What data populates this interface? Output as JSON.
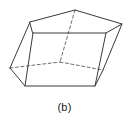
{
  "figure": {
    "caption": "(b)",
    "shape_name": "oblique-pentagonal-prism",
    "colors": {
      "background": "#ffffff",
      "edge_visible": "#3a3a3a",
      "edge_hidden": "#6e6e6e",
      "caption_text": "#1a1a1a"
    },
    "stroke": {
      "visible_width": 1,
      "hidden_width": 1,
      "hidden_dash": "3,2.5"
    },
    "viewbox": "0 0 129 96",
    "vertices": {
      "top_back_left": [
        30,
        22
      ],
      "top_apex": [
        75,
        10
      ],
      "top_back_right": [
        122,
        24
      ],
      "top_front_right": [
        106,
        33
      ],
      "top_front_left": [
        33,
        33
      ],
      "bottom_back_left": [
        10,
        68
      ],
      "bottom_apex": [
        60,
        62
      ],
      "bottom_back_right": [
        103,
        70
      ],
      "bottom_front_right": [
        95,
        86
      ],
      "bottom_front_left": [
        25,
        86
      ]
    },
    "edges_visible": [
      {
        "name": "top-edge-back-left-to-apex",
        "from": [
          30,
          22
        ],
        "to": [
          75,
          10
        ]
      },
      {
        "name": "top-edge-apex-to-back-right",
        "from": [
          75,
          10
        ],
        "to": [
          122,
          24
        ]
      },
      {
        "name": "top-edge-back-right-to-front-right",
        "from": [
          122,
          24
        ],
        "to": [
          106,
          33
        ]
      },
      {
        "name": "top-edge-front-right-to-front-left",
        "from": [
          106,
          33
        ],
        "to": [
          33,
          33
        ]
      },
      {
        "name": "top-edge-front-left-to-back-left",
        "from": [
          33,
          33
        ],
        "to": [
          30,
          22
        ]
      },
      {
        "name": "lateral-edge-back-left",
        "from": [
          30,
          22
        ],
        "to": [
          10,
          68
        ]
      },
      {
        "name": "lateral-edge-front-left",
        "from": [
          33,
          33
        ],
        "to": [
          25,
          86
        ]
      },
      {
        "name": "lateral-edge-front-right",
        "from": [
          106,
          33
        ],
        "to": [
          95,
          86
        ]
      },
      {
        "name": "lateral-edge-back-right",
        "from": [
          122,
          24
        ],
        "to": [
          103,
          70
        ]
      },
      {
        "name": "bottom-edge-front-left-to-front-right",
        "from": [
          25,
          86
        ],
        "to": [
          95,
          86
        ]
      },
      {
        "name": "bottom-edge-back-left-to-front-left",
        "from": [
          10,
          68
        ],
        "to": [
          25,
          86
        ]
      },
      {
        "name": "bottom-edge-front-right-to-back-right",
        "from": [
          95,
          86
        ],
        "to": [
          103,
          70
        ]
      }
    ],
    "edges_hidden": [
      {
        "name": "hidden-lateral-edge-apex",
        "from": [
          75,
          10
        ],
        "to": [
          60,
          62
        ]
      },
      {
        "name": "hidden-bottom-edge-back-left-to-apex",
        "from": [
          10,
          68
        ],
        "to": [
          60,
          62
        ]
      },
      {
        "name": "hidden-bottom-edge-apex-to-back-right",
        "from": [
          60,
          62
        ],
        "to": [
          103,
          70
        ]
      }
    ]
  }
}
